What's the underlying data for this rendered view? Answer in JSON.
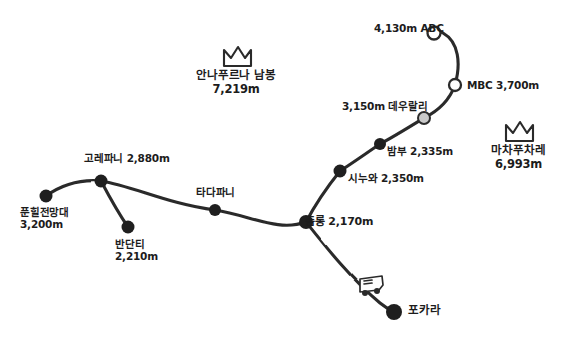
{
  "map": {
    "title": "Annapurna Base Camp trekking route hand-drawn map",
    "background": "#ffffff",
    "ink": "#1f1f1f",
    "watermark": "",
    "peaks": [
      {
        "id": "annapurna-south",
        "name": "안나푸르나 남봉",
        "altitude": "7,219m",
        "icon": "crown-icon",
        "x": 236,
        "y": 56
      },
      {
        "id": "machapuchare",
        "name": "마차푸차레",
        "altitude": "6,993m",
        "icon": "crown-icon",
        "x": 518,
        "y": 131
      }
    ],
    "nodes": [
      {
        "id": "poon-hill",
        "name": "푼힐전망대",
        "altitude": "3,200m",
        "style": "filled",
        "x": 46,
        "y": 196,
        "r": 6.5,
        "label_x": 22,
        "label_y": 206,
        "align": "left"
      },
      {
        "id": "ghorepani",
        "name": "고레파니",
        "altitude": "2,880m",
        "style": "filled",
        "x": 101,
        "y": 181,
        "r": 6.5,
        "label_x": 86,
        "label_y": 149,
        "align": "left"
      },
      {
        "id": "bhanthanti",
        "name": "반단티",
        "altitude": "2,210m",
        "style": "filled",
        "x": 128,
        "y": 227,
        "r": 6.5,
        "label_x": 117,
        "label_y": 237,
        "align": "left"
      },
      {
        "id": "tadapani",
        "name": "타다파니",
        "altitude": "",
        "style": "filled",
        "x": 215,
        "y": 210,
        "r": 6,
        "label_x": 198,
        "label_y": 186,
        "align": "left"
      },
      {
        "id": "chhomrong",
        "name": "촘롱",
        "altitude": "2,170m",
        "style": "filled",
        "x": 306,
        "y": 222,
        "r": 7,
        "label_x": 306,
        "label_y": 213,
        "align": "left"
      },
      {
        "id": "sinuwa",
        "name": "시누와",
        "altitude": "2,350m",
        "style": "filled",
        "x": 340,
        "y": 171,
        "r": 6.5,
        "label_x": 349,
        "label_y": 168,
        "align": "left"
      },
      {
        "id": "bamboo",
        "name": "밤부",
        "altitude": "2,335m",
        "style": "filled",
        "x": 380,
        "y": 144,
        "r": 6,
        "label_x": 388,
        "label_y": 142,
        "align": "left"
      },
      {
        "id": "deurali",
        "name": "데우랄리",
        "altitude": "3,150m",
        "style": "light",
        "x": 424,
        "y": 118,
        "r": 6,
        "label_x": 343,
        "label_y": 98,
        "align": "left"
      },
      {
        "id": "mbc",
        "name": "MBC",
        "altitude": "3,700m",
        "style": "hollow",
        "x": 455,
        "y": 85,
        "r": 6,
        "label_x": 467,
        "label_y": 78,
        "align": "left"
      },
      {
        "id": "abc",
        "name": "ABC",
        "altitude": "4,130m",
        "style": "hollow",
        "x": 434,
        "y": 33,
        "r": 6.5,
        "label_x": 375,
        "label_y": 22,
        "align": "left"
      },
      {
        "id": "pokhara",
        "name": "포카라",
        "altitude": "",
        "style": "filled",
        "x": 394,
        "y": 312,
        "r": 8,
        "label_x": 408,
        "label_y": 303,
        "align": "left"
      }
    ],
    "vehicle_icon": {
      "id": "bus-icon",
      "name": "bus-icon",
      "x": 366,
      "y": 285
    },
    "legs": [
      {
        "from": "poon-hill",
        "to": "ghorepani"
      },
      {
        "from": "ghorepani",
        "to": "bhanthanti"
      },
      {
        "from": "ghorepani",
        "to": "tadapani"
      },
      {
        "from": "tadapani",
        "to": "chhomrong"
      },
      {
        "from": "chhomrong",
        "to": "sinuwa"
      },
      {
        "from": "sinuwa",
        "to": "bamboo"
      },
      {
        "from": "bamboo",
        "to": "deurali"
      },
      {
        "from": "deurali",
        "to": "mbc"
      },
      {
        "from": "mbc",
        "to": "abc"
      },
      {
        "from": "chhomrong",
        "to": "pokhara"
      }
    ]
  }
}
